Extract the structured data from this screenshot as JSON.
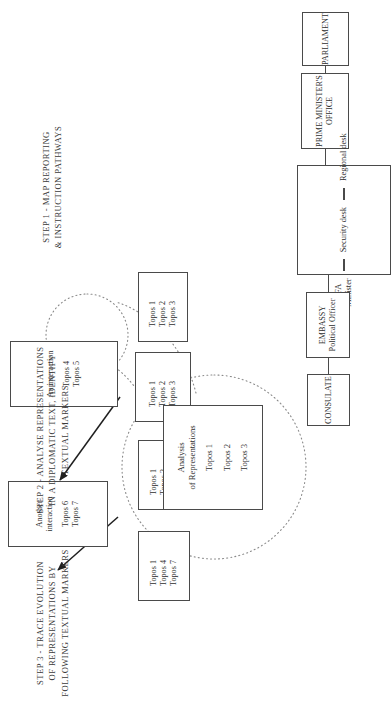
{
  "figure": {
    "orientation": "rotated-90-ccw",
    "line_color": "#4a4a4a",
    "text_color": "#2e2e2e",
    "background": "#ffffff"
  },
  "step1": {
    "caption": {
      "line1": "STEP 1 - MAP REPORTING",
      "line2": "& INSTRUCTION PATHWAYS"
    },
    "parliament": {
      "label": "PARLIAMENT"
    },
    "pmo": {
      "line1": "PRIME MINISTER'S",
      "line2": "OFFICE"
    },
    "mfa": {
      "line1": "MFA",
      "line2": "Minister",
      "desk1": "Security desk",
      "desk2": "Regional desk"
    },
    "embassy": {
      "line1": "EMBASSY",
      "line2": "Political Officer"
    },
    "consulate": {
      "label": "CONSULATE"
    }
  },
  "step2": {
    "caption": {
      "line1": "STEP 2 - ANALYSE REPRESENTATIONS",
      "line2": "IN A DIPLOMATIC TEXT, IDENTIFY",
      "line3": "TEXTUAL MARKERS"
    },
    "analysis_box": {
      "line1": "Analysis",
      "line2": "of Representations",
      "topos1": "Topos 1",
      "topos2": "Topos 2",
      "topos3": "Topos 3"
    }
  },
  "step3": {
    "caption": {
      "line1": "STEP 3 - TRACE EVOLUTION",
      "line2": "OF REPRESENTATIONS BY",
      "line3": "FOLLOWING TEXTUAL MARKERS"
    },
    "topos_boxes": [
      {
        "name": "topos-box-1",
        "items": [
          "Topos 1",
          "Topos 2",
          "Topos 3"
        ]
      },
      {
        "name": "topos-box-2",
        "items": [
          "Topos 1",
          "Topos 2",
          "Topos 3"
        ]
      },
      {
        "name": "topos-box-3",
        "items": [
          "Topos 1",
          "Topos 2",
          "Topos 4"
        ]
      },
      {
        "name": "topos-box-4",
        "items": [
          "Topos 1",
          "Topos 4",
          "Topos 7"
        ]
      }
    ],
    "interactions": [
      {
        "name": "interaction-box-1",
        "title_line1": "An interaction",
        "title_line2": "",
        "topos_a": "Topos 4",
        "topos_b": "Topos 5"
      },
      {
        "name": "interaction-box-2",
        "title_line1": "Another",
        "title_line2": "interaction",
        "topos_a": "Topos 6",
        "topos_b": "Topos 7"
      }
    ]
  }
}
